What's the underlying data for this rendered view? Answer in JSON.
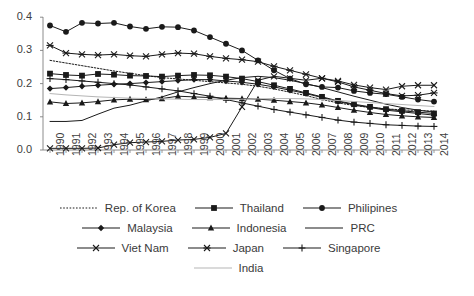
{
  "chart_data": {
    "type": "line",
    "title": "",
    "subtitle": "",
    "xlabel": "",
    "ylabel": "",
    "grid": false,
    "legend_position": "bottom",
    "ylim": [
      0.0,
      0.4
    ],
    "yticks": [
      "0.0",
      "0.1",
      "0.2",
      "0.3",
      "0.4"
    ],
    "ytick_values": [
      0.0,
      0.1,
      0.2,
      0.3,
      0.4
    ],
    "categories": [
      "1990",
      "1991",
      "1992",
      "1993",
      "1994",
      "1995",
      "1996",
      "1997",
      "1998",
      "1999",
      "2000",
      "2001",
      "2002",
      "2003",
      "2004",
      "2005",
      "2006",
      "2007",
      "2008",
      "2009",
      "2010",
      "2011",
      "2012",
      "2013",
      "2014"
    ],
    "series": [
      {
        "name": "Rep. of Korea",
        "marker": "none",
        "dash": "dotted",
        "values": [
          0.27,
          0.262,
          0.254,
          0.246,
          0.238,
          0.231,
          0.224,
          0.218,
          0.214,
          0.21,
          0.206,
          0.202,
          0.198,
          0.192,
          0.184,
          0.174,
          0.164,
          0.152,
          0.142,
          0.134,
          0.128,
          0.124,
          0.121,
          0.119,
          0.117
        ]
      },
      {
        "name": "Thailand",
        "marker": "square",
        "dash": "solid",
        "values": [
          0.23,
          0.226,
          0.224,
          0.229,
          0.227,
          0.224,
          0.223,
          0.221,
          0.224,
          0.226,
          0.225,
          0.221,
          0.215,
          0.206,
          0.195,
          0.184,
          0.172,
          0.16,
          0.148,
          0.138,
          0.13,
          0.123,
          0.118,
          0.114,
          0.11
        ]
      },
      {
        "name": "Philipines",
        "marker": "circle",
        "dash": "solid",
        "values": [
          0.375,
          0.356,
          0.383,
          0.381,
          0.383,
          0.372,
          0.365,
          0.371,
          0.37,
          0.36,
          0.34,
          0.32,
          0.3,
          0.27,
          0.24,
          0.215,
          0.198,
          0.19,
          0.188,
          0.178,
          0.172,
          0.168,
          0.16,
          0.152,
          0.146
        ]
      },
      {
        "name": "Malaysia",
        "marker": "diamond",
        "dash": "solid",
        "values": [
          0.185,
          0.188,
          0.192,
          0.195,
          0.198,
          0.2,
          0.203,
          0.206,
          0.209,
          0.212,
          0.212,
          0.208,
          0.204,
          0.198,
          0.19,
          0.18,
          0.17,
          0.158,
          0.146,
          0.136,
          0.128,
          0.12,
          0.115,
          0.11,
          0.105
        ]
      },
      {
        "name": "Indonesia",
        "marker": "triangle",
        "dash": "solid",
        "values": [
          0.145,
          0.14,
          0.142,
          0.146,
          0.151,
          0.153,
          0.152,
          0.155,
          0.162,
          0.16,
          0.158,
          0.156,
          0.155,
          0.153,
          0.15,
          0.146,
          0.142,
          0.136,
          0.128,
          0.12,
          0.113,
          0.107,
          0.103,
          0.1,
          0.098
        ]
      },
      {
        "name": "PRC",
        "marker": "none",
        "dash": "solid",
        "values": [
          0.086,
          0.086,
          0.089,
          0.108,
          0.126,
          0.135,
          0.148,
          0.16,
          0.175,
          0.188,
          0.2,
          0.21,
          0.218,
          0.222,
          0.218,
          0.21,
          0.2,
          0.188,
          0.175,
          0.162,
          0.15,
          0.138,
          0.128,
          0.12,
          0.114
        ]
      },
      {
        "name": "Viet Nam",
        "marker": "x",
        "dash": "solid",
        "values": [
          0.005,
          0.005,
          0.005,
          0.006,
          0.016,
          0.022,
          0.024,
          0.026,
          0.03,
          0.032,
          0.038,
          0.05,
          0.13,
          0.21,
          0.222,
          0.216,
          0.21,
          0.216,
          0.208,
          0.196,
          0.188,
          0.182,
          0.192,
          0.195,
          0.195
        ]
      },
      {
        "name": "Japan",
        "marker": "asterisk",
        "dash": "solid",
        "values": [
          0.315,
          0.292,
          0.288,
          0.286,
          0.288,
          0.284,
          0.282,
          0.288,
          0.292,
          0.29,
          0.282,
          0.276,
          0.272,
          0.266,
          0.252,
          0.24,
          0.228,
          0.216,
          0.205,
          0.19,
          0.18,
          0.17,
          0.163,
          0.165,
          0.172
        ]
      },
      {
        "name": "Singapore",
        "marker": "plus",
        "dash": "solid",
        "values": [
          0.215,
          0.212,
          0.208,
          0.204,
          0.2,
          0.196,
          0.19,
          0.184,
          0.178,
          0.17,
          0.162,
          0.152,
          0.142,
          0.132,
          0.122,
          0.114,
          0.106,
          0.098,
          0.09,
          0.084,
          0.08,
          0.076,
          0.074,
          0.072,
          0.071
        ]
      },
      {
        "name": "India",
        "marker": "none",
        "dash": "solid-light",
        "values": [
          0.17,
          0.166,
          0.163,
          0.16,
          0.158,
          0.156,
          0.155,
          0.154,
          0.153,
          0.152,
          0.152,
          0.152,
          0.153,
          0.154,
          0.155,
          0.155,
          0.154,
          0.152,
          0.149,
          0.146,
          0.143,
          0.14,
          0.137,
          0.134,
          0.131
        ]
      }
    ]
  },
  "legend": {
    "rows": [
      [
        {
          "label": "Rep. of Korea",
          "key": "rep-of-korea"
        },
        {
          "label": "Thailand",
          "key": "thailand"
        },
        {
          "label": "Philipines",
          "key": "philipines"
        }
      ],
      [
        {
          "label": "Malaysia",
          "key": "malaysia"
        },
        {
          "label": "Indonesia",
          "key": "indonesia"
        },
        {
          "label": "PRC",
          "key": "prc"
        }
      ],
      [
        {
          "label": "Viet Nam",
          "key": "viet-nam"
        },
        {
          "label": "Japan",
          "key": "japan"
        },
        {
          "label": "Singapore",
          "key": "singapore"
        }
      ],
      [
        {
          "label": "India",
          "key": "india"
        }
      ]
    ]
  },
  "colors": {
    "line": "#1a1a1a",
    "light_line": "#b5b5b5",
    "axis": "#808080",
    "text": "#3a3a3a"
  }
}
